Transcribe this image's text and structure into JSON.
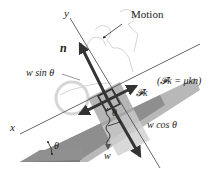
{
  "diagram": {
    "labels": {
      "motion": "Motion",
      "y_axis": "y",
      "x_axis": "x",
      "normal": "n",
      "w_sin": "w sin θ",
      "friction_eq": "(𝓕k = μkn)",
      "friction": "𝓕k",
      "w_cos": "w cos θ",
      "theta_incline": "θ",
      "theta_block": "θ",
      "weight": "w"
    },
    "colors": {
      "ramp": "#8c8c8c",
      "ramp_light": "#b5b5b5",
      "block": "#a8a8a8",
      "arrow": "#3a3a3a",
      "axis": "#444444",
      "sketch": "#c8c8c8"
    }
  }
}
